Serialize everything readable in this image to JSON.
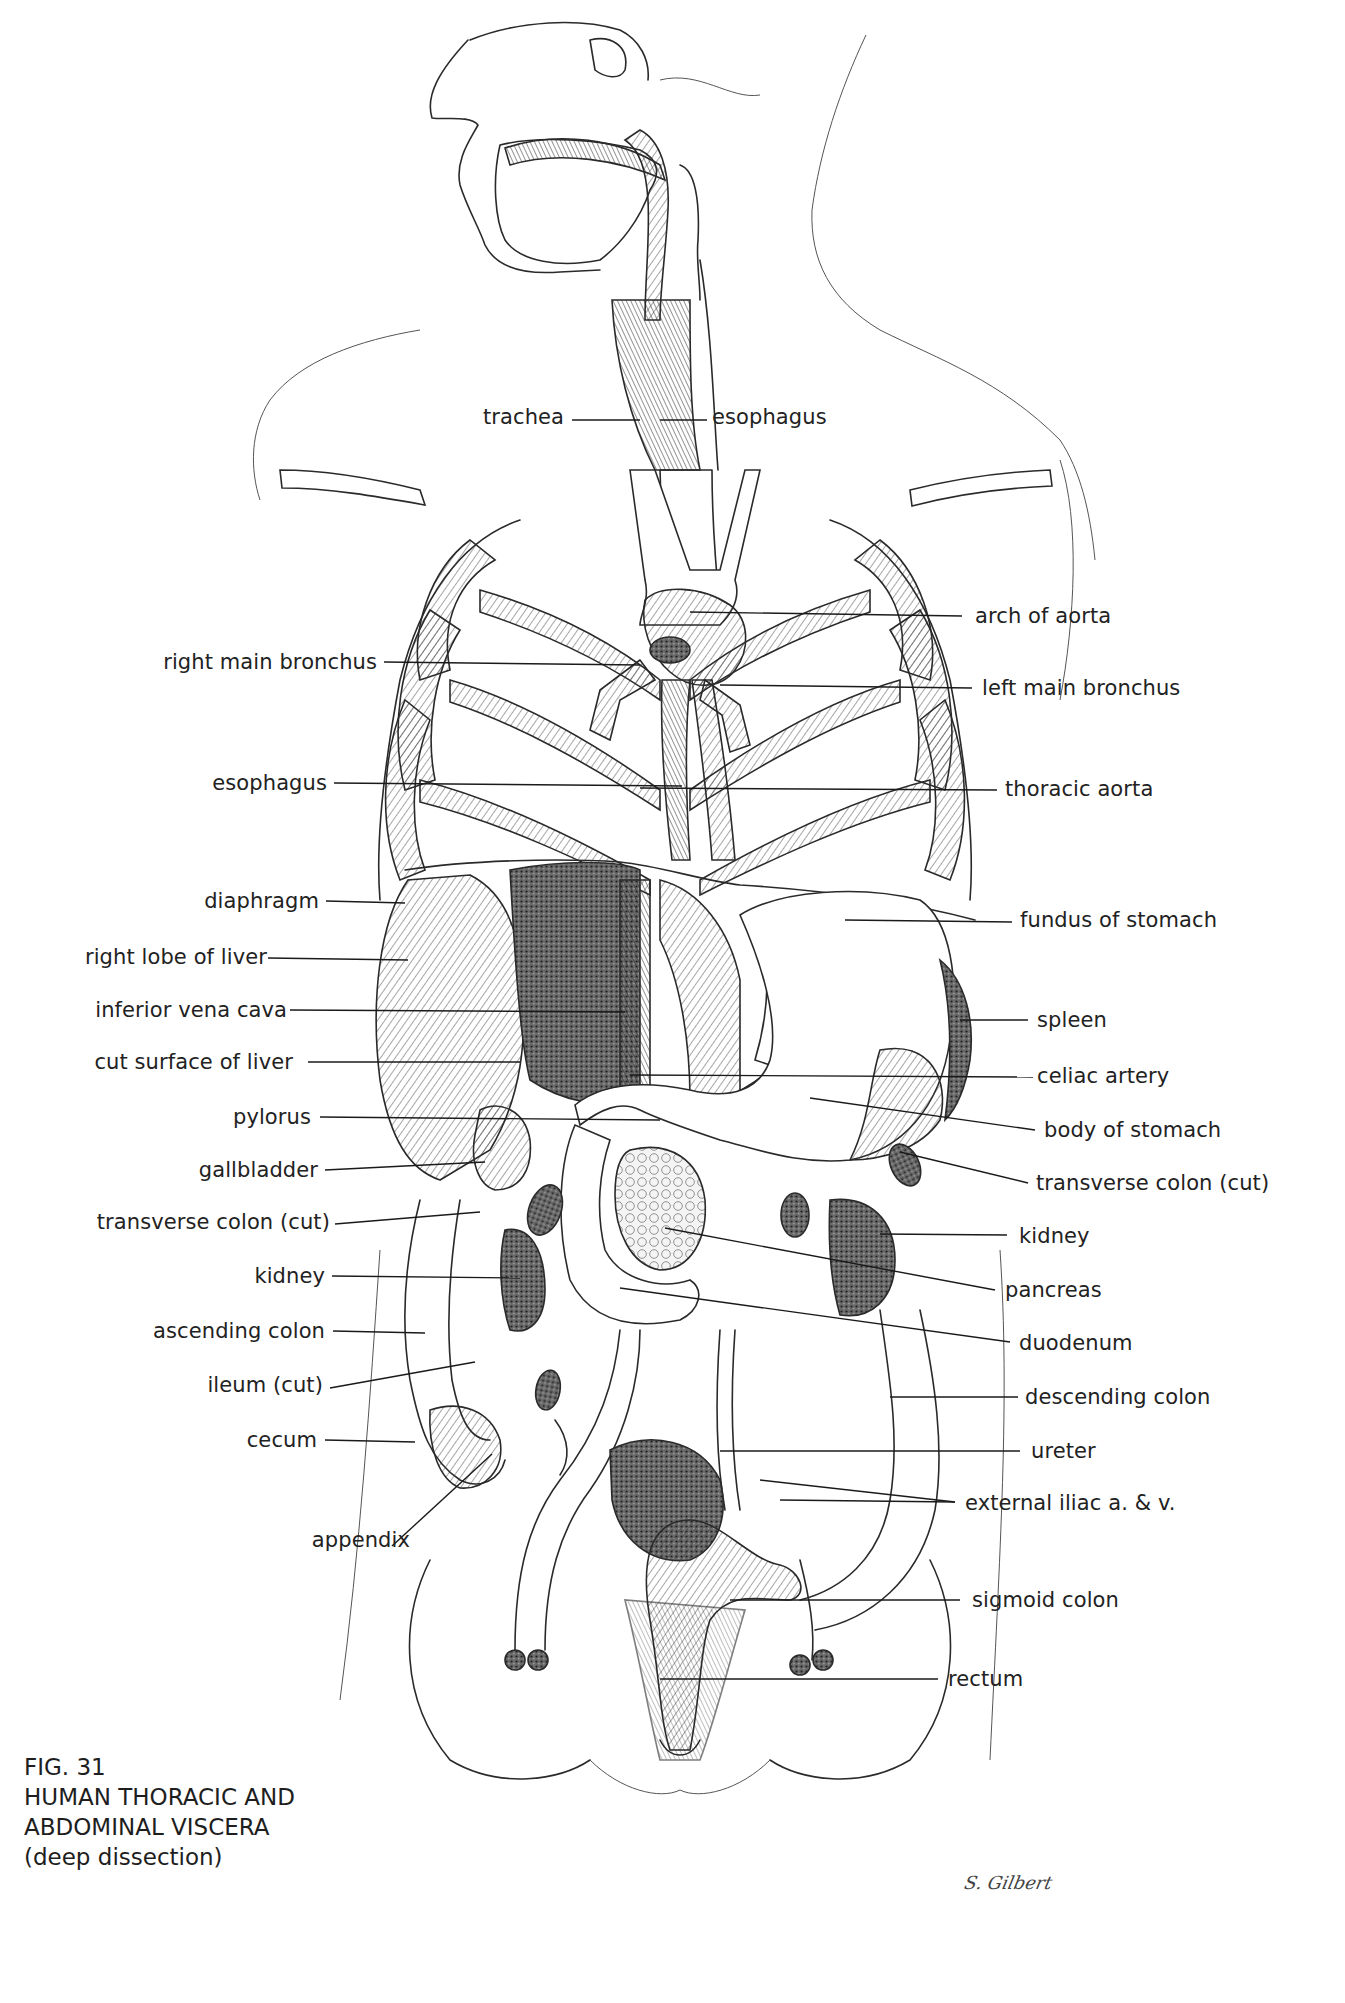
{
  "figure": {
    "number": "FIG. 31",
    "title_line1": "HUMAN THORACIC AND",
    "title_line2": "ABDOMINAL VISCERA",
    "subtitle": "(deep dissection)",
    "signature": "S. Gilbert"
  },
  "labels": {
    "top": [
      {
        "id": "trachea",
        "text": "trachea"
      },
      {
        "id": "esophagus-top",
        "text": "esophagus"
      }
    ],
    "left": [
      {
        "id": "right-main-bronchus",
        "text": "right main bronchus"
      },
      {
        "id": "esophagus",
        "text": "esophagus"
      },
      {
        "id": "diaphragm",
        "text": "diaphragm"
      },
      {
        "id": "right-lobe-of-liver",
        "text": "right lobe of liver"
      },
      {
        "id": "inferior-vena-cava",
        "text": "inferior vena cava"
      },
      {
        "id": "cut-surface-of-liver",
        "text": "cut surface of liver"
      },
      {
        "id": "pylorus",
        "text": "pylorus"
      },
      {
        "id": "gallbladder",
        "text": "gallbladder"
      },
      {
        "id": "transverse-colon-cut-left",
        "text": "transverse colon (cut)"
      },
      {
        "id": "kidney-left",
        "text": "kidney"
      },
      {
        "id": "ascending-colon",
        "text": "ascending colon"
      },
      {
        "id": "ileum-cut",
        "text": "ileum (cut)"
      },
      {
        "id": "cecum",
        "text": "cecum"
      },
      {
        "id": "appendix",
        "text": "appendix"
      }
    ],
    "right": [
      {
        "id": "arch-of-aorta",
        "text": "arch of aorta"
      },
      {
        "id": "left-main-bronchus",
        "text": "left main bronchus"
      },
      {
        "id": "thoracic-aorta",
        "text": "thoracic aorta"
      },
      {
        "id": "fundus-of-stomach",
        "text": "fundus of stomach"
      },
      {
        "id": "spleen",
        "text": "spleen"
      },
      {
        "id": "celiac-artery",
        "text": "celiac artery"
      },
      {
        "id": "body-of-stomach",
        "text": "body of stomach"
      },
      {
        "id": "transverse-colon-cut-right",
        "text": "transverse colon (cut)"
      },
      {
        "id": "kidney-right",
        "text": "kidney"
      },
      {
        "id": "pancreas",
        "text": "pancreas"
      },
      {
        "id": "duodenum",
        "text": "duodenum"
      },
      {
        "id": "descending-colon",
        "text": "descending colon"
      },
      {
        "id": "ureter",
        "text": "ureter"
      },
      {
        "id": "external-iliac",
        "text": "external iliac a. & v."
      },
      {
        "id": "sigmoid-colon",
        "text": "sigmoid colon"
      },
      {
        "id": "rectum",
        "text": "rectum"
      }
    ]
  }
}
